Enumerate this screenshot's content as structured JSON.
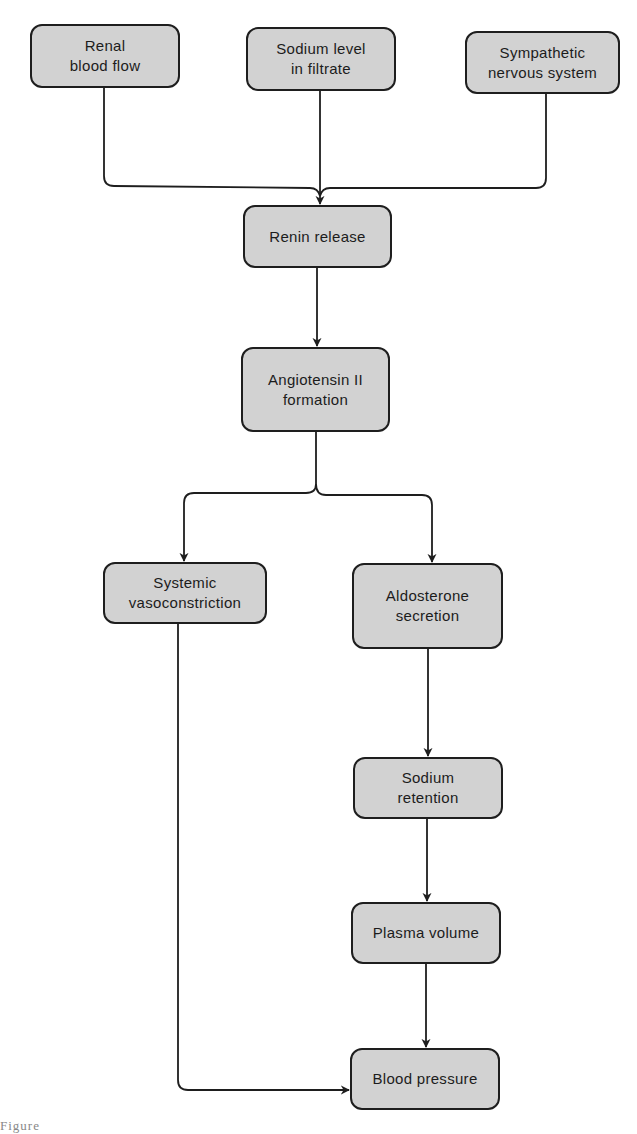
{
  "diagram": {
    "type": "flowchart",
    "colors": {
      "node_fill": "#d2d2d2",
      "node_border": "#1e1e1e",
      "line": "#1e1e1e",
      "background": "#ffffff"
    },
    "nodes": {
      "renal_blood_flow": {
        "label": "Renal\nblood flow"
      },
      "sodium_level": {
        "label": "Sodium level\nin filtrate"
      },
      "sympathetic": {
        "label": "Sympathetic\nnervous system"
      },
      "renin_release": {
        "label": "Renin release"
      },
      "angiotensin": {
        "label": "Angiotensin II\nformation"
      },
      "systemic_vaso": {
        "label": "Systemic\nvasoconstriction"
      },
      "aldosterone": {
        "label": "Aldosterone\nsecretion"
      },
      "sodium_retention": {
        "label": "Sodium\nretention"
      },
      "plasma_volume": {
        "label": "Plasma volume"
      },
      "blood_pressure": {
        "label": "Blood pressure"
      }
    },
    "edges": [
      {
        "from": "renal_blood_flow",
        "to": "renin_release"
      },
      {
        "from": "sodium_level",
        "to": "renin_release"
      },
      {
        "from": "sympathetic",
        "to": "renin_release"
      },
      {
        "from": "renin_release",
        "to": "angiotensin"
      },
      {
        "from": "angiotensin",
        "to": "systemic_vaso"
      },
      {
        "from": "angiotensin",
        "to": "aldosterone"
      },
      {
        "from": "aldosterone",
        "to": "sodium_retention"
      },
      {
        "from": "sodium_retention",
        "to": "plasma_volume"
      },
      {
        "from": "plasma_volume",
        "to": "blood_pressure"
      },
      {
        "from": "systemic_vaso",
        "to": "blood_pressure"
      }
    ],
    "caption": "Figure"
  }
}
